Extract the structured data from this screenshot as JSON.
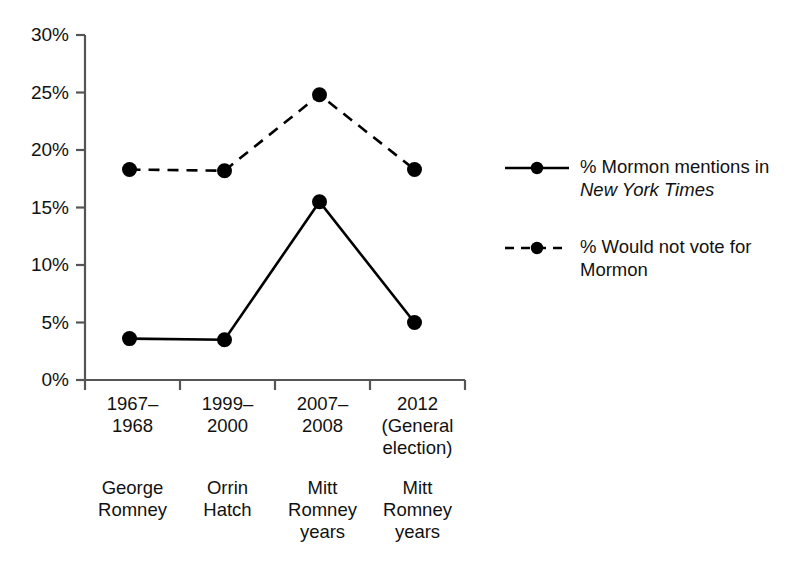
{
  "chart_data": {
    "type": "line",
    "title": "",
    "subtitle": "",
    "xlabel": "",
    "ylabel": "",
    "ylim": [
      0,
      30
    ],
    "ytick_labels": [
      "30%",
      "25%",
      "20%",
      "15%",
      "10%",
      "5%",
      "0%"
    ],
    "ytick_values": [
      30,
      25,
      20,
      15,
      10,
      5,
      0
    ],
    "grid": false,
    "legend_position": "right",
    "categories": [
      "1967–\n1968",
      "1999–\n2000",
      "2007–\n2008",
      "2012\n(General\nelection)"
    ],
    "category_subtitles": [
      "George\nRomney",
      "Orrin\nHatch",
      "Mitt\nRomney\nyears",
      "Mitt\nRomney\nyears"
    ],
    "series": [
      {
        "name": "% Mormon mentions in New York Times",
        "name_plain": "% Mormon mentions in ",
        "name_italic": "New York Times",
        "style": "solid",
        "marker": "filled-circle",
        "color": "#000000",
        "values": [
          3.6,
          3.5,
          15.5,
          5.0
        ]
      },
      {
        "name": "% Would not vote for Mormon",
        "name_plain": "% Would not vote for Mormon",
        "name_italic": "",
        "style": "dashed",
        "marker": "filled-circle",
        "color": "#000000",
        "values": [
          18.3,
          18.2,
          24.8,
          18.3
        ]
      }
    ]
  },
  "legend": {
    "entries": [
      {
        "label_lead": "% Mormon mentions in",
        "label_italic": "New York Times",
        "style": "solid"
      },
      {
        "label_lead": "% Would not vote for",
        "label_italic": "",
        "label_tail": "Mormon",
        "style": "dashed"
      }
    ]
  },
  "axes": {
    "axis_color": "#555555",
    "line_color": "#000000",
    "text_color": "#111111"
  }
}
